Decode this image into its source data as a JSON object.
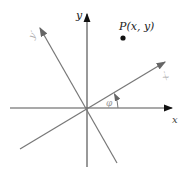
{
  "diagram": {
    "type": "rotated-coordinate-axes",
    "labels": {
      "x_axis": "x",
      "y_axis": "y",
      "x_prime_axis": "x′",
      "y_prime_axis": "y′",
      "angle": "φ",
      "point": "P(x, y)"
    },
    "colors": {
      "original_axes": "#1a1a1a",
      "rotated_axes": "#7a7a7a",
      "prime_labels": "#9a9a9a",
      "point": "#111111"
    }
  }
}
